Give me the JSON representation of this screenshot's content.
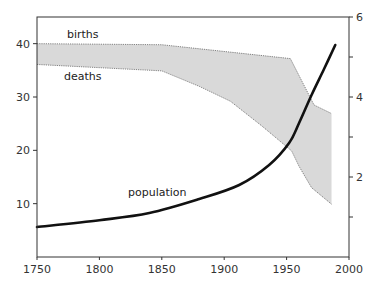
{
  "chart_data": {
    "type": "area",
    "title": "",
    "xlabel": "",
    "ylabel_left": "",
    "ylabel_right": "",
    "x_ticks": [
      1750,
      1800,
      1850,
      1900,
      1950,
      2000
    ],
    "xlim": [
      1750,
      2000
    ],
    "y_left": {
      "ticks": [
        10,
        20,
        30,
        40
      ],
      "lim": [
        0,
        45
      ]
    },
    "y_right": {
      "ticks": [
        2,
        4,
        6
      ],
      "minor_ticks": [
        1,
        3,
        5
      ],
      "lim": [
        0,
        6
      ]
    },
    "grid": false,
    "legend": "inline labels",
    "series": [
      {
        "name": "births",
        "axis": "left",
        "style": "dotted line, top edge of shaded band",
        "x": [
          1750,
          1850,
          1953,
          1960,
          1972,
          1986
        ],
        "values": [
          40.0,
          39.8,
          37.2,
          34.0,
          28.5,
          26.9
        ]
      },
      {
        "name": "deaths",
        "axis": "left",
        "style": "dotted line, bottom edge of shaded band",
        "x": [
          1750,
          1850,
          1880,
          1905,
          1930,
          1954,
          1960,
          1970,
          1986
        ],
        "values": [
          36.1,
          34.9,
          32.0,
          29.2,
          24.6,
          19.9,
          17.0,
          13.0,
          9.9
        ]
      },
      {
        "name": "population",
        "axis": "right",
        "style": "thick solid black line",
        "x": [
          1750,
          1800,
          1840,
          1880,
          1912,
          1936,
          1952,
          1960,
          1970,
          1980,
          1989
        ],
        "values": [
          0.75,
          0.92,
          1.1,
          1.45,
          1.8,
          2.3,
          2.85,
          3.35,
          4.05,
          4.7,
          5.3
        ]
      }
    ],
    "annotations": [
      {
        "text": "births",
        "x": 1776,
        "y": 41.4
      },
      {
        "text": "deaths",
        "x": 1773,
        "y": 33.8
      },
      {
        "text": "population",
        "x": 1822,
        "y": 12.0
      }
    ]
  },
  "labels": {
    "births": "births",
    "deaths": "deaths",
    "population": "population"
  },
  "colors": {
    "band_fill": "#d9d9d9",
    "band_edge": "#666666",
    "population_line": "#111111",
    "axis": "#333333"
  }
}
